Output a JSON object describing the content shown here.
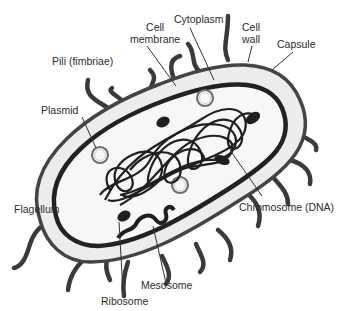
{
  "diagram": {
    "labels": {
      "cell_membrane_line1": "Cell",
      "cell_membrane_line2": "membrane",
      "cytoplasm": "Cytoplasm",
      "cell_wall_line1": "Cell",
      "cell_wall_line2": "wall",
      "capsule": "Capsule",
      "pili": "Pili (fimbriae)",
      "plasmid": "Plasmid",
      "flagellum": "Flagellum",
      "chromosome": "Chromosome (DNA)",
      "mesosome": "Mesosome",
      "ribosome": "Ribosome"
    },
    "colors": {
      "outline": "#2a2a2a",
      "capsule_fill": "#ececec",
      "cytoplasm_fill": "#f7f7f7",
      "plasmid_ring": "#6f6f6f",
      "label_text": "#2b2b2b",
      "leader_line": "#333333"
    }
  }
}
